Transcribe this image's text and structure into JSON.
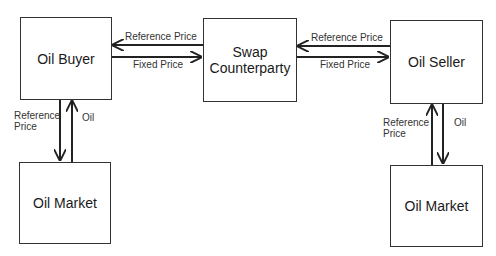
{
  "nodes": {
    "oil_buyer": "Oil Buyer",
    "swap_counterparty_line1": "Swap",
    "swap_counterparty_line2": "Counterparty",
    "oil_seller": "Oil Seller",
    "oil_market_left": "Oil Market",
    "oil_market_right": "Oil Market"
  },
  "edges": {
    "buyer_swap_reference": "Reference Price",
    "buyer_swap_fixed": "Fixed Price",
    "swap_seller_reference": "Reference Price",
    "swap_seller_fixed": "Fixed Price",
    "left_reference_line1": "Reference",
    "left_reference_line2": "Price",
    "left_oil": "Oil",
    "right_reference_line1": "Reference",
    "right_reference_line2": "Price",
    "right_oil": "Oil"
  },
  "colors": {
    "stroke": "#333333",
    "background": "#ffffff"
  }
}
